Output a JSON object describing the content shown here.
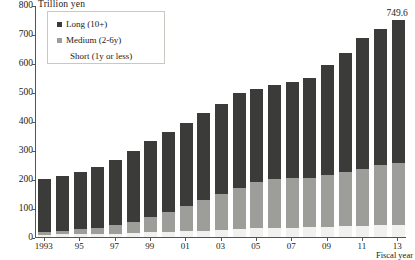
{
  "chart_data": {
    "type": "bar",
    "stacked": true,
    "title": "",
    "ylabel": "Trillion yen",
    "xlabel": "Fiscal year",
    "ylim": [
      0,
      800
    ],
    "ytick_values": [
      0,
      100,
      200,
      300,
      400,
      500,
      600,
      700,
      800
    ],
    "ytick_labels": [
      "0",
      "100",
      "200",
      "300",
      "400",
      "500",
      "600",
      "700",
      "800"
    ],
    "grid": false,
    "legend_position": "top-left",
    "categories": [
      "1993",
      "1994",
      "1995",
      "1996",
      "1997",
      "1998",
      "1999",
      "2000",
      "2001",
      "2002",
      "2003",
      "2004",
      "2005",
      "2006",
      "2007",
      "2008",
      "2009",
      "2010",
      "2011",
      "2012",
      "2013"
    ],
    "xtick_labels": [
      "1993",
      "95",
      "97",
      "99",
      "01",
      "03",
      "05",
      "07",
      "09",
      "11",
      "13"
    ],
    "xtick_indices": [
      0,
      2,
      4,
      6,
      8,
      10,
      12,
      14,
      16,
      18,
      20
    ],
    "series": [
      {
        "name": "Short (1y or less)",
        "color": "#f1f1ef",
        "values": [
          8,
          9,
          10,
          11,
          12,
          14,
          16,
          18,
          20,
          22,
          24,
          27,
          30,
          31,
          32,
          33,
          35,
          37,
          39,
          41,
          43
        ]
      },
      {
        "name": "Medium (2-6y)",
        "color": "#9d9d9a",
        "values": [
          10,
          12,
          16,
          21,
          28,
          37,
          52,
          68,
          86,
          104,
          124,
          142,
          160,
          168,
          170,
          172,
          178,
          186,
          196,
          206,
          212
        ]
      },
      {
        "name": "Long (10+)",
        "color": "#3b3b39",
        "values": [
          182,
          190,
          199,
          211,
          227,
          247,
          264,
          275,
          288,
          300,
          312,
          326,
          320,
          325,
          332,
          342,
          381,
          411,
          450,
          472,
          494.6
        ]
      }
    ],
    "totals": [
      200,
      211,
      225,
      243,
      267,
      298,
      332,
      361,
      394,
      426,
      460,
      495,
      510,
      524,
      534,
      547,
      594,
      634,
      685,
      719,
      749.6
    ],
    "annotations": [
      {
        "text": "749.6",
        "category": "2013",
        "value": 749.6
      }
    ]
  },
  "legend": {
    "items": [
      {
        "label": "Long (10+)",
        "swatch": "sw-long",
        "indent": false
      },
      {
        "label": "Medium (2-6y)",
        "swatch": "sw-medium",
        "indent": false
      },
      {
        "label": "Short (1y or less)",
        "swatch": "sw-none",
        "indent": true
      }
    ]
  }
}
